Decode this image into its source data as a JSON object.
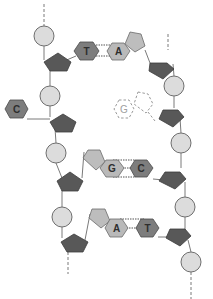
{
  "diagram": {
    "legend": {
      "phosphate": "phosphate-circle",
      "sugar": "deoxyribose-pentagon",
      "base": "nitrogenous-base-hexagon"
    },
    "colors": {
      "phosphate_fill": "#dcdcdc",
      "sugar_fill": "#585858",
      "purine_base_fill": "#b9b9b9",
      "pyrimidine_base_fill": "#7d7d7d",
      "background": "#ffffff"
    },
    "base_pairs": [
      {
        "left": "T",
        "right": "A",
        "hydrogen_bonds": 2
      },
      {
        "left": "G",
        "right": "C",
        "hydrogen_bonds": 3
      },
      {
        "left": "A",
        "right": "T",
        "hydrogen_bonds": 2
      }
    ],
    "unpaired_bases": [
      {
        "label": "C",
        "strand": "left",
        "state": "attached"
      },
      {
        "label": "G",
        "strand": "right",
        "state": "missing-dashed"
      }
    ]
  }
}
